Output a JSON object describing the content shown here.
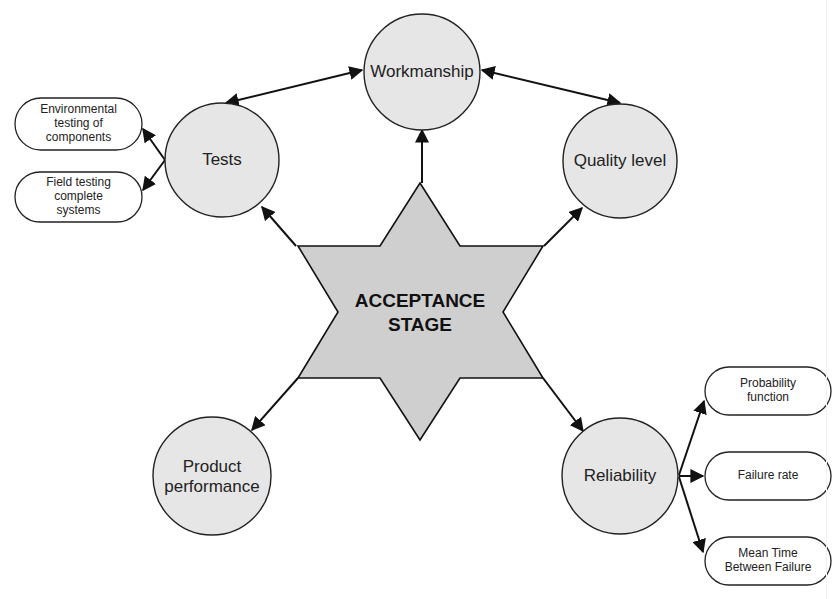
{
  "diagram": {
    "center": {
      "label_line1": "ACCEPTANCE",
      "label_line2": "STAGE",
      "fill": "#cfcfcf"
    },
    "nodes": [
      {
        "id": "workmanship",
        "label": "Workmanship"
      },
      {
        "id": "tests",
        "label": "Tests"
      },
      {
        "id": "quality-level",
        "label": "Quality level"
      },
      {
        "id": "product-performance",
        "label_line1": "Product",
        "label_line2": "performance"
      },
      {
        "id": "reliability",
        "label": "Reliability"
      }
    ],
    "tests_children": [
      {
        "label_line1": "Environmental",
        "label_line2": "testing of",
        "label_line3": "components"
      },
      {
        "label_line1": "Field testing",
        "label_line2": "complete",
        "label_line3": "systems"
      }
    ],
    "reliability_children": [
      {
        "label_line1": "Probability",
        "label_line2": "function"
      },
      {
        "label": "Failure rate"
      },
      {
        "label_line1": "Mean Time",
        "label_line2": "Between Failure"
      }
    ],
    "colors": {
      "node_fill": "#e6e6e6",
      "star_fill": "#cfcfcf",
      "stroke": "#222222",
      "background": "#ffffff"
    }
  }
}
